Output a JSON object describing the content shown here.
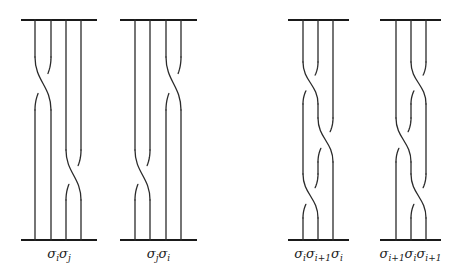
{
  "figure": {
    "colors": {
      "line": "#2a2a2a",
      "bar": "#1a1a1a",
      "background": "#ffffff"
    },
    "top_y": 20,
    "bottom_y": 240,
    "diagrams": [
      {
        "id": "sigma-i-sigma-j",
        "label_parts": [
          {
            "base": "σ",
            "sub": "i"
          },
          {
            "base": "σ",
            "sub": "j"
          }
        ],
        "label_text": "σ_i σ_j",
        "bar_x": [
          21,
          97
        ],
        "strands_x": [
          35,
          51,
          66,
          81
        ],
        "crossings": [
          {
            "left": 0,
            "y1": 57,
            "y2": 110
          },
          {
            "left": 2,
            "y1": 150,
            "y2": 200
          }
        ]
      },
      {
        "id": "sigma-j-sigma-i",
        "label_parts": [
          {
            "base": "σ",
            "sub": "j"
          },
          {
            "base": "σ",
            "sub": "i"
          }
        ],
        "label_text": "σ_j σ_i",
        "bar_x": [
          120,
          197
        ],
        "strands_x": [
          135,
          150,
          166,
          181
        ],
        "crossings": [
          {
            "left": 2,
            "y1": 57,
            "y2": 110
          },
          {
            "left": 0,
            "y1": 150,
            "y2": 200
          }
        ]
      },
      {
        "id": "sigma-i-sigma-i1-sigma-i",
        "label_parts": [
          {
            "base": "σ",
            "sub": "i"
          },
          {
            "base": "σ",
            "sub": "i+1"
          },
          {
            "base": "σ",
            "sub": "i"
          }
        ],
        "label_text": "σ_i σ_{i+1} σ_i",
        "bar_x": [
          288,
          349
        ],
        "strands_x": [
          303,
          318,
          333
        ],
        "crossings": [
          {
            "left": 0,
            "y1": 62,
            "y2": 104
          },
          {
            "left": 1,
            "y1": 118,
            "y2": 162
          },
          {
            "left": 0,
            "y1": 174,
            "y2": 218
          }
        ]
      },
      {
        "id": "sigma-i1-sigma-i-sigma-i1",
        "label_parts": [
          {
            "base": "σ",
            "sub": "i+1"
          },
          {
            "base": "σ",
            "sub": "i"
          },
          {
            "base": "σ",
            "sub": "i+1"
          }
        ],
        "label_text": "σ_{i+1} σ_i σ_{i+1}",
        "bar_x": [
          380,
          441
        ],
        "strands_x": [
          396,
          411,
          426
        ],
        "crossings": [
          {
            "left": 1,
            "y1": 62,
            "y2": 104
          },
          {
            "left": 0,
            "y1": 118,
            "y2": 162
          },
          {
            "left": 1,
            "y1": 174,
            "y2": 218
          }
        ]
      }
    ],
    "label_y": 246
  }
}
